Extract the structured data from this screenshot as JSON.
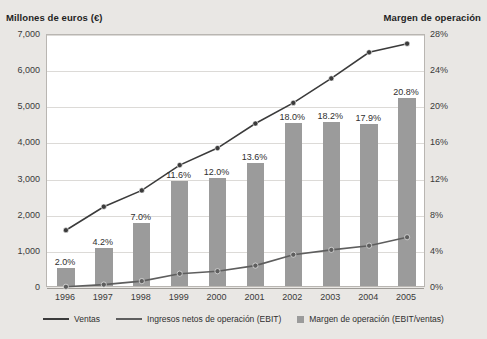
{
  "axis_titles": {
    "left": "Millones de euros (€)",
    "right": "Margen de operación"
  },
  "legend": [
    {
      "label": "Ventas",
      "marker": "line",
      "color": "#3b3b3b"
    },
    {
      "label": "Ingresos netos de operación (EBIT)",
      "marker": "line",
      "color": "#5e5e5e"
    },
    {
      "label": "Margen de operación (EBIT/ventas)",
      "marker": "square",
      "color": "#9b9b9b"
    }
  ],
  "chart_data": {
    "type": "bar",
    "title": "",
    "subtitle": "",
    "xlabel": "",
    "ylabel": "Millones de euros (€)",
    "y2label": "Margen de operación",
    "categories": [
      "1996",
      "1997",
      "1998",
      "1999",
      "2000",
      "2001",
      "2002",
      "2003",
      "2004",
      "2005"
    ],
    "ylim": [
      0,
      7000
    ],
    "yticks": [
      0,
      1000,
      2000,
      3000,
      4000,
      5000,
      6000,
      7000
    ],
    "ytick_labels": [
      "0",
      "1,000",
      "2,000",
      "3,000",
      "4,000",
      "5,000",
      "6,000",
      "7,000"
    ],
    "y2lim": [
      0,
      28
    ],
    "y2ticks": [
      0,
      4,
      8,
      12,
      16,
      20,
      24,
      28
    ],
    "y2tick_labels": [
      "0%",
      "4%",
      "8%",
      "12%",
      "16%",
      "20%",
      "24%",
      "28%"
    ],
    "grid": true,
    "legend_position": "bottom",
    "series": [
      {
        "name": "Margen de operación (EBIT/ventas)",
        "type": "bar",
        "axis": "right",
        "unit": "%",
        "color": "#9b9b9b",
        "values": [
          2.0,
          4.2,
          7.0,
          11.6,
          12.0,
          13.6,
          18.0,
          18.2,
          17.9,
          20.8
        ],
        "data_labels": [
          "2.0%",
          "4.2%",
          "7.0%",
          "11.6%",
          "12.0%",
          "13.6%",
          "18.0%",
          "18.2%",
          "17.9%",
          "20.8%"
        ]
      },
      {
        "name": "Ventas",
        "type": "line",
        "axis": "left",
        "unit": "M€",
        "color": "#3b3b3b",
        "values": [
          1600,
          2250,
          2700,
          3400,
          3870,
          4550,
          5120,
          5800,
          6520,
          6760
        ]
      },
      {
        "name": "Ingresos netos de operación (EBIT)",
        "type": "line",
        "axis": "left",
        "unit": "M€",
        "color": "#5e5e5e",
        "values": [
          32,
          95,
          190,
          395,
          465,
          620,
          920,
          1055,
          1170,
          1405
        ]
      }
    ]
  }
}
